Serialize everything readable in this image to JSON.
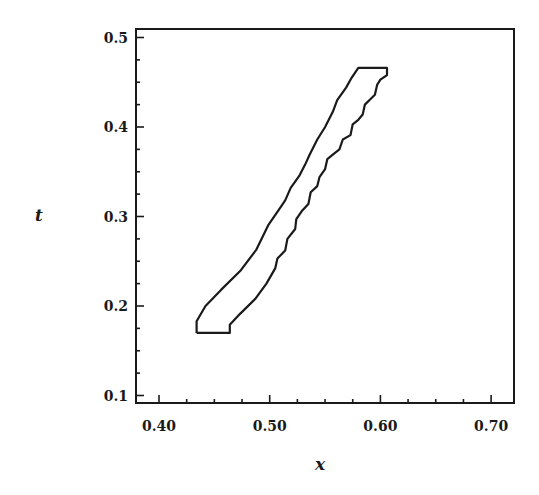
{
  "chart_data": {
    "type": "line",
    "title": "",
    "xlabel": "x",
    "ylabel": "t",
    "xlim": [
      0.38,
      0.72
    ],
    "ylim": [
      0.09,
      0.51
    ],
    "x_ticks": [
      0.4,
      0.5,
      0.6,
      0.7
    ],
    "x_tick_labels": [
      "0.40",
      "0.50",
      "0.60",
      "0.70"
    ],
    "y_ticks": [
      0.1,
      0.2,
      0.3,
      0.4,
      0.5
    ],
    "y_tick_labels": [
      "0.1",
      "0.2",
      "0.3",
      "0.4",
      "0.5"
    ],
    "grid": false,
    "legend": null,
    "series": [
      {
        "name": "closed contour (left boundary)",
        "x": [
          0.434,
          0.434,
          0.442,
          0.456,
          0.474,
          0.488,
          0.499,
          0.508,
          0.514,
          0.519,
          0.527,
          0.532,
          0.536,
          0.543,
          0.55,
          0.557,
          0.561,
          0.569,
          0.574,
          0.58
        ],
        "t": [
          0.17,
          0.183,
          0.2,
          0.218,
          0.24,
          0.263,
          0.291,
          0.307,
          0.318,
          0.332,
          0.346,
          0.358,
          0.369,
          0.386,
          0.4,
          0.417,
          0.43,
          0.444,
          0.455,
          0.466
        ]
      },
      {
        "name": "closed contour (right boundary)",
        "x": [
          0.606,
          0.606,
          0.6,
          0.597,
          0.595,
          0.59,
          0.586,
          0.584,
          0.58,
          0.575,
          0.573,
          0.566,
          0.563,
          0.557,
          0.552,
          0.55,
          0.545,
          0.543,
          0.537,
          0.535,
          0.529,
          0.524,
          0.523,
          0.516,
          0.514,
          0.507,
          0.505,
          0.497,
          0.487,
          0.473,
          0.464,
          0.464,
          0.434
        ],
        "t": [
          0.466,
          0.458,
          0.453,
          0.447,
          0.436,
          0.43,
          0.425,
          0.414,
          0.408,
          0.403,
          0.391,
          0.386,
          0.375,
          0.369,
          0.364,
          0.353,
          0.344,
          0.334,
          0.327,
          0.314,
          0.306,
          0.297,
          0.286,
          0.275,
          0.262,
          0.253,
          0.242,
          0.225,
          0.208,
          0.191,
          0.179,
          0.17,
          0.17
        ]
      }
    ]
  },
  "axes": {
    "x_title": "x",
    "y_title": "t"
  }
}
